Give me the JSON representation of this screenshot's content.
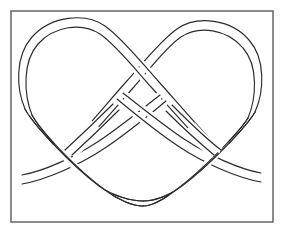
{
  "figure": {
    "title": "Rope knot line diagram",
    "kind": "line-drawing",
    "background_color": "#ffffff",
    "ink_color": "#2b2b2b",
    "frame_color": "#6e6e6e",
    "frame": {
      "x": 11,
      "y": 11,
      "width": 262,
      "height": 211,
      "stroke_width": 1.6
    },
    "rope": {
      "stroke_width": 1.15,
      "band_width": 7.2,
      "strand_count": 2,
      "crossing_count": 4,
      "loop_count": 2,
      "free_end_count": 2
    },
    "parts": [
      {
        "name": "left-loop",
        "label": "Left rounded loop",
        "apex_x": 76,
        "apex_y": 29
      },
      {
        "name": "right-loop",
        "label": "Right rounded loop",
        "apex_x": 198,
        "apex_y": 33
      },
      {
        "name": "center-crossing",
        "label": "Upper center crossing",
        "x": 142,
        "y": 93
      },
      {
        "name": "left-crossing",
        "label": "Lower left crossing",
        "x": 76,
        "y": 155
      },
      {
        "name": "right-crossing",
        "label": "Lower right crossing",
        "x": 203,
        "y": 152
      },
      {
        "name": "bottom-bight",
        "label": "Bottom rounded bight",
        "x": 143,
        "y": 203
      },
      {
        "name": "left-tail",
        "label": "Left free end",
        "x": 22,
        "y": 182
      },
      {
        "name": "right-tail",
        "label": "Right free end",
        "x": 262,
        "y": 180
      }
    ]
  }
}
